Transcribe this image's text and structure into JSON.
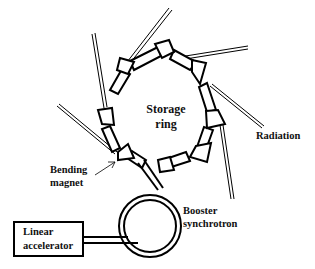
{
  "diagram": {
    "labels": {
      "storage_ring_line1": "Storage",
      "storage_ring_line2": "ring",
      "radiation": "Radiation",
      "bending_magnet_line1": "Bending",
      "bending_magnet_line2": "magnet",
      "booster_line1": "Booster",
      "booster_line2": "synchrotron",
      "linac_line1": "Linear",
      "linac_line2": "accelerator"
    },
    "components": [
      {
        "id": "storage-ring",
        "label": "Storage ring",
        "magnet_count": 8
      },
      {
        "id": "booster-synchrotron",
        "label": "Booster synchrotron"
      },
      {
        "id": "linear-accelerator",
        "label": "Linear accelerator"
      },
      {
        "id": "bending-magnet",
        "label": "Bending magnet"
      },
      {
        "id": "radiation",
        "label": "Radiation",
        "beamline_count": 6
      }
    ],
    "colors": {
      "line": "#000000",
      "background": "#ffffff"
    }
  }
}
